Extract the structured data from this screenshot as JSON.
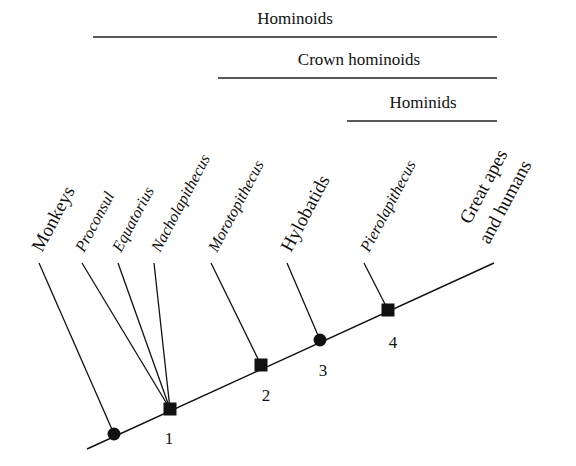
{
  "groups": [
    {
      "label": "Hominoids",
      "x1": 93,
      "x2": 497,
      "y": 37,
      "tx": 295,
      "ty": 24
    },
    {
      "label": "Crown hominoids",
      "x1": 218,
      "x2": 497,
      "y": 78,
      "tx": 359,
      "ty": 65
    },
    {
      "label": "Hominids",
      "x1": 347,
      "x2": 497,
      "y": 121,
      "tx": 423,
      "ty": 108
    }
  ],
  "taxa": [
    {
      "label": "Monkeys",
      "italic": false
    },
    {
      "label": "Proconsul",
      "italic": true
    },
    {
      "label": "Equatorius",
      "italic": true
    },
    {
      "label": "Nacholapithecus",
      "italic": true
    },
    {
      "label": "Morotopithecus",
      "italic": true
    },
    {
      "label": "Hylobatids",
      "italic": false
    },
    {
      "label": "Pierolapithecus",
      "italic": true
    },
    {
      "label": "Great apes",
      "italic": false
    },
    {
      "label": "and humans",
      "italic": false
    }
  ],
  "nodes": [
    {
      "label": "",
      "shape": "circle"
    },
    {
      "label": "1",
      "shape": "square"
    },
    {
      "label": "2",
      "shape": "square"
    },
    {
      "label": "3",
      "shape": "circle"
    },
    {
      "label": "4",
      "shape": "square"
    }
  ]
}
